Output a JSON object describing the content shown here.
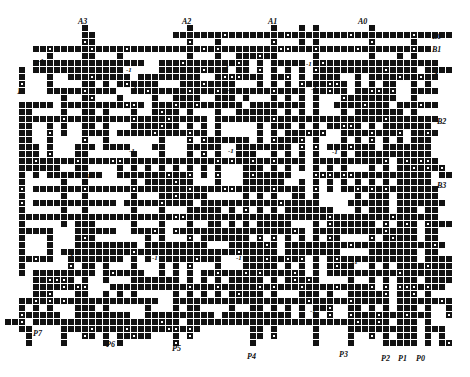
{
  "diagram": {
    "kind": "vlsi-routing-grid",
    "canvas": {
      "width": 470,
      "height": 377,
      "background": "#ffffff"
    },
    "grid": {
      "cell_px": 6,
      "pitch_px": 7,
      "origin_x": 5,
      "origin_y": 18,
      "cols": 64,
      "rows": 48
    },
    "colors": {
      "wire": "#121212",
      "via_fill": "#ffffff",
      "text": "#101010"
    },
    "cell_types": {
      "solid": "filled square segment",
      "ring": "square segment with white center (via)"
    }
  },
  "labels": {
    "top": [
      {
        "text": "A3",
        "x": 78,
        "y": 18
      },
      {
        "text": "A2",
        "x": 182,
        "y": 18
      },
      {
        "text": "A1",
        "x": 268,
        "y": 18
      },
      {
        "text": "A0",
        "x": 358,
        "y": 18
      }
    ],
    "right": [
      {
        "text": "B0",
        "x": 432,
        "y": 33
      },
      {
        "text": "B1",
        "x": 432,
        "y": 46
      },
      {
        "text": "-1",
        "x": 432,
        "y": 68
      },
      {
        "text": "B2",
        "x": 437,
        "y": 118
      },
      {
        "text": "B3",
        "x": 437,
        "y": 182
      }
    ],
    "left": [
      {
        "text": "1",
        "x": 17,
        "y": 88
      }
    ],
    "bottom": [
      {
        "text": "P7",
        "x": 33,
        "y": 330
      },
      {
        "text": "P6",
        "x": 106,
        "y": 341
      },
      {
        "text": "P5",
        "x": 172,
        "y": 345
      },
      {
        "text": "P4",
        "x": 247,
        "y": 353
      },
      {
        "text": "P3",
        "x": 339,
        "y": 351
      },
      {
        "text": "P2",
        "x": 381,
        "y": 355
      },
      {
        "text": "P1",
        "x": 398,
        "y": 355
      },
      {
        "text": "P0",
        "x": 416,
        "y": 355
      }
    ],
    "inline_minus_one": [
      {
        "text": "-1",
        "x": 38,
        "y": 57
      },
      {
        "text": "-1",
        "x": 126,
        "y": 66
      },
      {
        "text": "-1",
        "x": 131,
        "y": 85
      },
      {
        "text": "-1",
        "x": 223,
        "y": 64
      },
      {
        "text": "-1",
        "x": 227,
        "y": 86
      },
      {
        "text": "-1",
        "x": 306,
        "y": 60
      },
      {
        "text": "-1",
        "x": 311,
        "y": 85
      },
      {
        "text": "-1",
        "x": 352,
        "y": 114
      },
      {
        "text": "-1",
        "x": 85,
        "y": 172
      },
      {
        "text": "-1",
        "x": 129,
        "y": 147
      },
      {
        "text": "-1",
        "x": 228,
        "y": 147
      },
      {
        "text": "-1",
        "x": 332,
        "y": 148
      },
      {
        "text": "-1",
        "x": 68,
        "y": 250
      },
      {
        "text": "-1",
        "x": 152,
        "y": 254
      },
      {
        "text": "-1",
        "x": 236,
        "y": 254
      },
      {
        "text": "-1",
        "x": 352,
        "y": 258
      },
      {
        "text": "-1",
        "x": 310,
        "y": 307
      }
    ]
  },
  "routes": {
    "h_bars": [
      {
        "col": 44,
        "row": 2,
        "len": 20,
        "ring_at": []
      },
      {
        "col": 6,
        "row": 4,
        "len": 54,
        "ring_at": [
          12,
          30,
          44,
          58
        ]
      },
      {
        "col": 4,
        "row": 7,
        "len": 12,
        "ring_at": []
      },
      {
        "col": 22,
        "row": 7,
        "len": 10,
        "ring_at": []
      },
      {
        "col": 44,
        "row": 7,
        "len": 14,
        "ring_at": []
      },
      {
        "col": 24,
        "row": 10,
        "len": 16,
        "ring_at": []
      },
      {
        "col": 2,
        "row": 14,
        "len": 22,
        "ring_at": []
      },
      {
        "col": 30,
        "row": 14,
        "len": 26,
        "ring_at": []
      },
      {
        "col": 2,
        "row": 20,
        "len": 40,
        "ring_at": [
          16,
          30,
          44
        ]
      },
      {
        "col": 6,
        "row": 24,
        "len": 34,
        "ring_at": []
      },
      {
        "col": 2,
        "row": 28,
        "len": 48,
        "ring_at": []
      },
      {
        "col": 8,
        "row": 33,
        "len": 30,
        "ring_at": []
      },
      {
        "col": 18,
        "row": 38,
        "len": 24,
        "ring_at": []
      },
      {
        "col": 4,
        "row": 43,
        "len": 16,
        "ring_at": []
      },
      {
        "col": 26,
        "row": 43,
        "len": 22,
        "ring_at": []
      }
    ],
    "v_bars": [
      {
        "col": 44,
        "row": 0,
        "len": 48,
        "ring_at": []
      },
      {
        "col": 12,
        "row": 2,
        "len": 14,
        "ring_at": []
      },
      {
        "col": 30,
        "row": 2,
        "len": 20,
        "ring_at": []
      },
      {
        "col": 58,
        "row": 2,
        "len": 44,
        "ring_at": []
      },
      {
        "col": 52,
        "row": 12,
        "len": 34,
        "ring_at": []
      },
      {
        "col": 56,
        "row": 18,
        "len": 28,
        "ring_at": []
      },
      {
        "col": 22,
        "row": 14,
        "len": 22,
        "ring_at": []
      },
      {
        "col": 36,
        "row": 20,
        "len": 24,
        "ring_at": []
      }
    ]
  }
}
